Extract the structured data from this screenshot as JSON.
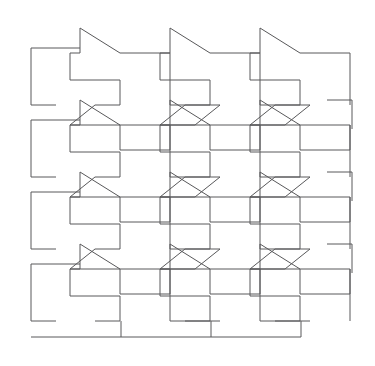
{
  "figure": {
    "background_color": "#ffffff",
    "line_color": "#58585a",
    "line_width": 1,
    "canvas": {
      "width": 375,
      "height": 366
    }
  },
  "chart_data": {
    "type": "diagram",
    "subtitle": "",
    "xlabel": "",
    "ylabel": "",
    "grid": false,
    "legend": [],
    "annotations": [],
    "tiling": {
      "shape_name": "houndstooth",
      "columns": 4,
      "rows": 4,
      "origin_x": 31,
      "origin_y": 28,
      "cell_width": 72,
      "cell_height": 72,
      "pattern_bounds": {
        "x": 31,
        "y": 28,
        "width": 321,
        "height": 309
      },
      "tile_outline_local": [
        [
          0,
          0
        ],
        [
          40,
          25
        ],
        [
          90,
          25
        ],
        [
          90,
          77
        ],
        [
          140,
          77
        ],
        [
          115,
          97
        ],
        [
          90,
          97
        ],
        [
          90,
          122
        ],
        [
          40,
          122
        ],
        [
          40,
          97
        ],
        [
          -10,
          97
        ],
        [
          15,
          77
        ],
        [
          40,
          77
        ],
        [
          40,
          52
        ],
        [
          -10,
          52
        ],
        [
          -10,
          25
        ],
        [
          0,
          25
        ]
      ],
      "tile_anchor_offsets": [
        {
          "col": 0,
          "row": 0,
          "x": 80,
          "y": 28
        },
        {
          "col": 1,
          "row": 0,
          "x": 170,
          "y": 28
        },
        {
          "col": 2,
          "row": 0,
          "x": 260,
          "y": 28
        },
        {
          "col": 0,
          "row": 1,
          "x": 80,
          "y": 100
        },
        {
          "col": 1,
          "row": 1,
          "x": 170,
          "y": 100
        },
        {
          "col": 2,
          "row": 1,
          "x": 260,
          "y": 100
        },
        {
          "col": 0,
          "row": 2,
          "x": 80,
          "y": 172
        },
        {
          "col": 1,
          "row": 2,
          "x": 170,
          "y": 172
        },
        {
          "col": 2,
          "row": 2,
          "x": 260,
          "y": 172
        },
        {
          "col": 0,
          "row": 3,
          "x": 80,
          "y": 244
        },
        {
          "col": 1,
          "row": 3,
          "x": 170,
          "y": 244
        },
        {
          "col": 2,
          "row": 3,
          "x": 260,
          "y": 244
        }
      ]
    }
  }
}
